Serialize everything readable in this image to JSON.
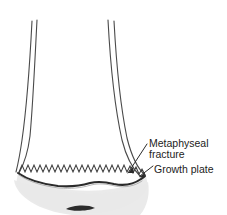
{
  "figure": {
    "background_color": "#ffffff",
    "line_color": "#3a3a3a",
    "fill_color": "#ffffff",
    "epiphysis_fill": "#e9e9e9",
    "text_color": "#1c1c1c"
  },
  "labels": {
    "metaphyseal_fracture": {
      "line1": "Metaphyseal",
      "line2": "fracture"
    },
    "growth_plate": "Growth plate"
  },
  "annotations": [
    {
      "name": "metaphyseal-fracture-leader",
      "from_x": 146,
      "from_y": 145,
      "to_x": 128,
      "to_y": 173
    },
    {
      "name": "growth-plate-leader",
      "from_x": 152,
      "from_y": 167,
      "to_x": 137,
      "to_y": 175
    }
  ],
  "structures": [
    {
      "name": "diaphysis-shaft",
      "description": "long bone shaft with double cortical lines"
    },
    {
      "name": "metaphysis-flare",
      "description": "flaring metaphysis widening toward the growth plate"
    },
    {
      "name": "growth-plate-zigzag",
      "description": "serrated zigzag line representing the physis"
    },
    {
      "name": "metaphyseal-fracture-line",
      "description": "dark irregular transverse fracture line below the physis"
    },
    {
      "name": "epiphysis",
      "description": "light gray epiphysis below the growth plate"
    },
    {
      "name": "ossification-center",
      "description": "small dark ellipse within the epiphysis"
    }
  ]
}
